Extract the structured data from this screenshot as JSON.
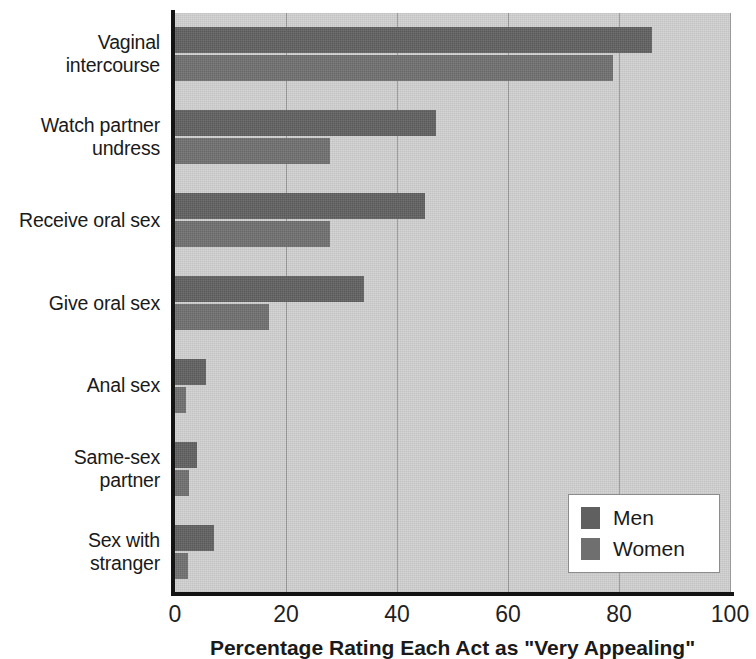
{
  "chart_data": {
    "type": "bar",
    "orientation": "horizontal",
    "title": "",
    "xlabel": "Percentage Rating Each Act as \"Very Appealing\"",
    "ylabel": "",
    "xlim": [
      0,
      100
    ],
    "xticks": [
      0,
      20,
      40,
      60,
      80,
      100
    ],
    "xtick_labels": [
      "0",
      "20",
      "40",
      "60",
      "80",
      "100"
    ],
    "grid": true,
    "grid_axis": "x",
    "legend_position": "bottom-right",
    "categories": [
      "Vaginal intercourse",
      "Watch partner undress",
      "Receive oral sex",
      "Give oral sex",
      "Anal sex",
      "Same-sex partner",
      "Sex with stranger"
    ],
    "category_lines": [
      [
        "Vaginal",
        "intercourse"
      ],
      [
        "Watch partner",
        "undress"
      ],
      [
        "Receive oral sex"
      ],
      [
        "Give oral sex"
      ],
      [
        "Anal sex"
      ],
      [
        "Same-sex",
        "partner"
      ],
      [
        "Sex with",
        "stranger"
      ]
    ],
    "series": [
      {
        "name": "Men",
        "color": "#606060",
        "values": [
          86,
          47,
          45,
          34,
          5.5,
          4,
          7
        ]
      },
      {
        "name": "Women",
        "color": "#6f6f6f",
        "values": [
          79,
          28,
          28,
          17,
          2,
          2.5,
          2.3
        ]
      }
    ]
  },
  "legend": {
    "items": [
      {
        "label": "Men",
        "color": "#606060"
      },
      {
        "label": "Women",
        "color": "#6f6f6f"
      }
    ]
  },
  "colors": {
    "plot_background": "#d1d1d1",
    "gridline": "#9a9a9a",
    "axis": "#141414",
    "men": "#606060",
    "women": "#6f6f6f",
    "legend_background": "#ffffff",
    "legend_border": "#8d8d8d",
    "text": "#1a1a1a"
  }
}
